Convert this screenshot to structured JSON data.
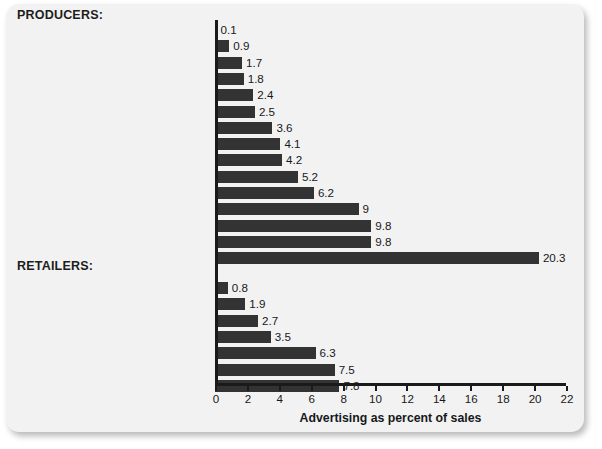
{
  "chart_data": {
    "type": "bar",
    "orientation": "horizontal",
    "title": "",
    "xlabel": "Advertising as percent of sales",
    "ylabel": "",
    "xlim": [
      0,
      22
    ],
    "xticks": [
      0,
      2,
      4,
      6,
      8,
      10,
      12,
      14,
      16,
      18,
      20,
      22
    ],
    "grid": false,
    "legend": null,
    "bar_color": "#333333",
    "groups": [
      {
        "name": "PRODUCERS:",
        "categories": [
          "Petroleum refining",
          "Computers and office equipment",
          "Plastic products",
          "Business services",
          "Dairy products",
          "Motor vehicles and car bodies",
          "Soft drinks, water",
          "Sugar and confectionary products",
          "Footwear (except rubber)",
          "Malt beverages",
          "Cable and other pay TV services",
          "Sporting and athletic goods",
          "Games and toys",
          "Soap and detergent",
          "Perfume and cosmetics"
        ],
        "values": [
          0.1,
          0.9,
          1.7,
          1.8,
          2.4,
          2.5,
          3.6,
          4.1,
          4.2,
          5.2,
          6.2,
          9,
          9.8,
          9.8,
          20.3
        ],
        "value_labels": [
          "0.1",
          "0.9",
          "1.7",
          "1.8",
          "2.4",
          "2.5",
          "3.6",
          "4.1",
          "4.2",
          "5.2",
          "6.2",
          "9",
          "9.8",
          "9.8",
          "20.3"
        ]
      },
      {
        "name": "RETAILERS:",
        "categories": [
          "Grocery stores",
          "Hotels and motels",
          "Eating places",
          "Women's clothing stores",
          "Jewelry stores",
          "Amusement parks",
          "Furniture stores"
        ],
        "values": [
          0.8,
          1.9,
          2.7,
          3.5,
          6.3,
          7.5,
          7.8
        ],
        "value_labels": [
          "0.8",
          "1.9",
          "2.7",
          "3.5",
          "6.3",
          "7.5",
          "7.8"
        ]
      }
    ]
  },
  "headers": {
    "producers": "PRODUCERS:",
    "retailers": "RETAILERS:"
  },
  "axis": {
    "title": "Advertising as percent of sales"
  }
}
